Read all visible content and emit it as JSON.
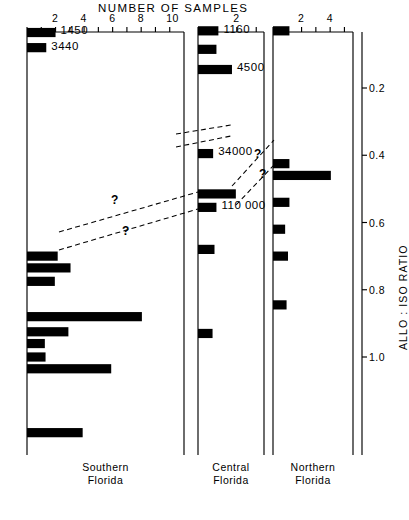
{
  "chart_data": {
    "type": "bar",
    "title": "NUMBER OF SAMPLES",
    "subtitle": "",
    "xlabel": "NUMBER OF SAMPLES",
    "ylabel": "ALLO : ISO RATIO",
    "orientation": "horizontal",
    "grid": false,
    "legend_position": "none",
    "y_axis": {
      "label": "ALLO : ISO RATIO",
      "ticks": [
        0.2,
        0.4,
        0.6,
        0.8,
        1.0
      ],
      "tick_labels": [
        "0.2",
        "0.4",
        "0.6",
        "0.8",
        "1.0"
      ],
      "ylim": [
        0.0,
        1.32
      ],
      "direction": "increasing-downward",
      "side": "right"
    },
    "panels": [
      {
        "name": "southern-florida",
        "label_line1": "Southern",
        "label_line2": "Florida",
        "xlim": [
          0,
          11
        ],
        "xticks": [
          0,
          1,
          2,
          3,
          4,
          5,
          6,
          7,
          8,
          9,
          10,
          11
        ],
        "xtick_labels": [
          {
            "value": 2,
            "text": "2"
          },
          {
            "value": 4,
            "text": "4"
          },
          {
            "value": 6,
            "text": "6"
          },
          {
            "value": 8,
            "text": "8"
          },
          {
            "value": 10,
            "text": "10"
          }
        ],
        "bars": [
          {
            "ratio": 0.035,
            "count": 2.0,
            "label": "1450"
          },
          {
            "ratio": 0.08,
            "count": 1.35,
            "label": "3440"
          },
          {
            "ratio": 0.7,
            "count": 2.15,
            "label": ""
          },
          {
            "ratio": 0.735,
            "count": 3.05,
            "label": ""
          },
          {
            "ratio": 0.775,
            "count": 1.95,
            "label": ""
          },
          {
            "ratio": 0.88,
            "count": 8.05,
            "label": ""
          },
          {
            "ratio": 0.925,
            "count": 2.9,
            "label": ""
          },
          {
            "ratio": 0.96,
            "count": 1.25,
            "label": ""
          },
          {
            "ratio": 1.0,
            "count": 1.3,
            "label": ""
          },
          {
            "ratio": 1.035,
            "count": 5.9,
            "label": ""
          },
          {
            "ratio": 1.225,
            "count": 3.9,
            "label": ""
          }
        ]
      },
      {
        "name": "central-florida",
        "label_line1": "Central",
        "label_line2": "Florida",
        "xlim": [
          0,
          3.4
        ],
        "xticks": [
          0,
          1,
          2,
          3
        ],
        "xtick_labels": [
          {
            "value": 2,
            "text": "2"
          }
        ],
        "bars": [
          {
            "ratio": 0.03,
            "count": 1.05,
            "label": "1160"
          },
          {
            "ratio": 0.085,
            "count": 0.95,
            "label": ""
          },
          {
            "ratio": 0.145,
            "count": 1.75,
            "label": "4500"
          },
          {
            "ratio": 0.395,
            "count": 0.78,
            "label": "34000"
          },
          {
            "ratio": 0.515,
            "count": 1.95,
            "label": ""
          },
          {
            "ratio": 0.555,
            "count": 0.95,
            "label": "110 000"
          },
          {
            "ratio": 0.68,
            "count": 0.85,
            "label": ""
          },
          {
            "ratio": 0.93,
            "count": 0.75,
            "label": ""
          }
        ]
      },
      {
        "name": "northern-florida",
        "label_line1": "Northern",
        "label_line2": "Florida",
        "xlim": [
          0,
          5.6
        ],
        "xticks": [
          0,
          1,
          2,
          3,
          4,
          5
        ],
        "xtick_labels": [
          {
            "value": 2,
            "text": "2"
          },
          {
            "value": 4,
            "text": "4"
          }
        ],
        "bars": [
          {
            "ratio": 0.03,
            "count": 1.15,
            "label": ""
          },
          {
            "ratio": 0.425,
            "count": 1.15,
            "label": ""
          },
          {
            "ratio": 0.46,
            "count": 4.05,
            "label": ""
          },
          {
            "ratio": 0.54,
            "count": 1.15,
            "label": ""
          },
          {
            "ratio": 0.62,
            "count": 0.85,
            "label": ""
          },
          {
            "ratio": 0.7,
            "count": 1.05,
            "label": ""
          },
          {
            "ratio": 0.845,
            "count": 0.95,
            "label": ""
          }
        ]
      }
    ],
    "correlation_lines": [
      {
        "name": "left-upper-tie",
        "question_mark": "?"
      },
      {
        "name": "left-lower-tie",
        "question_mark": "?"
      },
      {
        "name": "central-34000-tie-upper",
        "question_mark": ""
      },
      {
        "name": "central-34000-tie-lower",
        "question_mark": ""
      },
      {
        "name": "central-north-tie-upper",
        "question_mark": "?"
      },
      {
        "name": "central-north-tie-lower",
        "question_mark": "?"
      }
    ],
    "annotations": [
      {
        "text": "1450",
        "panel": "southern-florida"
      },
      {
        "text": "3440",
        "panel": "southern-florida"
      },
      {
        "text": "1160",
        "panel": "central-florida"
      },
      {
        "text": "4500",
        "panel": "central-florida"
      },
      {
        "text": "34000",
        "panel": "central-florida"
      },
      {
        "text": "110 000",
        "panel": "central-florida"
      }
    ],
    "colors": {
      "bar": "#000000",
      "axis": "#000000",
      "background": "#ffffff",
      "dashed": "#000000"
    }
  }
}
